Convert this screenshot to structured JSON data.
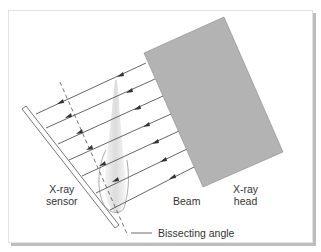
{
  "diagram": {
    "labels": {
      "sensor": "X-ray\nsensor",
      "beam": "Beam",
      "head": "X-ray\nhead",
      "bisecting": "Bissecting angle"
    },
    "colors": {
      "head_fill": "#b3b3b3",
      "head_stroke": "#8a8a8a",
      "line": "#555555",
      "arrow": "#333333",
      "dashed": "#666666",
      "tooth": "#dddddd",
      "outline": "#888888"
    },
    "beam_count": 7
  }
}
